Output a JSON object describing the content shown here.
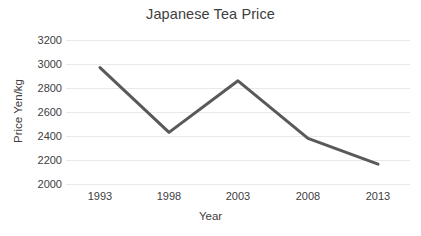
{
  "chart_data": {
    "type": "line",
    "title": "Japanese Tea Price",
    "xlabel": "Year",
    "ylabel": "Price Yen/kg",
    "categories": [
      "1993",
      "1998",
      "2003",
      "2008",
      "2013"
    ],
    "x": [
      1993,
      1998,
      2003,
      2008,
      2013
    ],
    "values": [
      2970,
      2430,
      2860,
      2380,
      2165
    ],
    "series": [
      {
        "name": "Price Yen/kg",
        "values": [
          2970,
          2430,
          2860,
          2380,
          2165
        ],
        "color": "#595959"
      }
    ],
    "ylim": [
      2000,
      3200
    ],
    "yticks": [
      2000,
      2200,
      2400,
      2600,
      2800,
      3000,
      3200
    ],
    "ytick_labels": [
      "2000",
      "2200",
      "2400",
      "2600",
      "2800",
      "3000",
      "3200"
    ],
    "xtick_labels": [
      "1993",
      "1998",
      "2003",
      "2008",
      "2013"
    ],
    "grid": "horizontal",
    "legend": "none",
    "line_width": 3,
    "markers": "none",
    "background_color": "#ffffff",
    "gridline_color": "#e9e9e9",
    "text_color": "#404040"
  }
}
